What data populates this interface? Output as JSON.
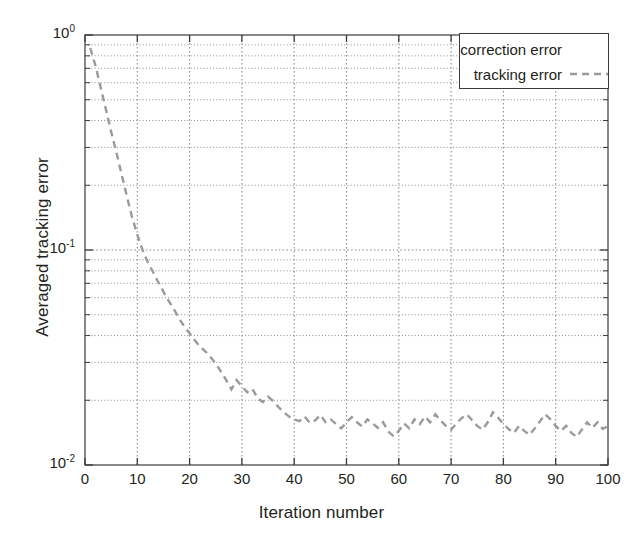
{
  "chart_data": {
    "type": "line",
    "title": "",
    "xlabel": "Iteration number",
    "ylabel": "Averaged tracking error",
    "yscale": "log",
    "xscale": "linear",
    "xlim": [
      0,
      100
    ],
    "ylim": [
      0.01,
      1
    ],
    "grid": true,
    "grid_style": "dotted",
    "grid_minor": true,
    "legend_position": "top-right",
    "xticks": [
      0,
      10,
      20,
      30,
      40,
      50,
      60,
      70,
      80,
      90,
      100
    ],
    "xtick_labels": [
      "0",
      "10",
      "20",
      "30",
      "40",
      "50",
      "60",
      "70",
      "80",
      "90",
      "100"
    ],
    "yticks": [
      0.01,
      0.1,
      1
    ],
    "ytick_labels": [
      "10⁻²",
      "10⁻¹",
      "10⁰"
    ],
    "ytick_mantissa": [
      "10",
      "10",
      "10"
    ],
    "ytick_exponent": [
      "-2",
      "-1",
      "0"
    ],
    "series": [
      {
        "name": "correction error",
        "linestyle": "solid",
        "color": "#ffffff",
        "visible_in_plot": false,
        "x": [],
        "values": []
      },
      {
        "name": "tracking error",
        "linestyle": "dashed",
        "color": "#9a9a9a",
        "visible_in_plot": true,
        "x": [
          1,
          2,
          3,
          4,
          5,
          6,
          7,
          8,
          9,
          10,
          11,
          12,
          13,
          14,
          15,
          16,
          17,
          18,
          19,
          20,
          21,
          22,
          23,
          24,
          25,
          26,
          27,
          28,
          29,
          30,
          31,
          32,
          33,
          34,
          35,
          36,
          37,
          38,
          39,
          40,
          41,
          42,
          43,
          44,
          45,
          46,
          47,
          48,
          49,
          50,
          51,
          52,
          53,
          54,
          55,
          56,
          57,
          58,
          59,
          60,
          61,
          62,
          63,
          64,
          65,
          66,
          67,
          68,
          69,
          70,
          71,
          72,
          73,
          74,
          75,
          76,
          77,
          78,
          79,
          80,
          81,
          82,
          83,
          84,
          85,
          86,
          87,
          88,
          89,
          90,
          91,
          92,
          93,
          94,
          95,
          96,
          97,
          98,
          99,
          100
        ],
        "values": [
          0.87,
          0.72,
          0.57,
          0.45,
          0.355,
          0.285,
          0.225,
          0.178,
          0.142,
          0.118,
          0.1,
          0.088,
          0.079,
          0.071,
          0.064,
          0.058,
          0.053,
          0.048,
          0.044,
          0.041,
          0.038,
          0.0355,
          0.0338,
          0.0318,
          0.0296,
          0.0272,
          0.0248,
          0.0225,
          0.0248,
          0.0232,
          0.0218,
          0.0226,
          0.0205,
          0.0196,
          0.0208,
          0.0198,
          0.0186,
          0.0176,
          0.0168,
          0.0163,
          0.016,
          0.0168,
          0.0157,
          0.0161,
          0.0171,
          0.0158,
          0.0163,
          0.0155,
          0.0148,
          0.0158,
          0.0167,
          0.0158,
          0.0151,
          0.0163,
          0.0156,
          0.0149,
          0.0158,
          0.0143,
          0.0136,
          0.0144,
          0.0156,
          0.0148,
          0.0163,
          0.0155,
          0.0168,
          0.0158,
          0.0172,
          0.0161,
          0.0152,
          0.0146,
          0.0156,
          0.0165,
          0.0172,
          0.0162,
          0.0152,
          0.0146,
          0.0158,
          0.0176,
          0.0166,
          0.0155,
          0.0147,
          0.0141,
          0.0152,
          0.0144,
          0.0138,
          0.0148,
          0.016,
          0.0172,
          0.0163,
          0.0152,
          0.0144,
          0.0152,
          0.0141,
          0.0135,
          0.0146,
          0.0158,
          0.0149,
          0.0158,
          0.0147,
          0.0152
        ]
      }
    ],
    "annotations": []
  },
  "legend": {
    "entries": [
      {
        "label": "correction error"
      },
      {
        "label": "tracking error"
      }
    ]
  },
  "axes": {
    "x_title": "Iteration number",
    "y_title": "Averaged tracking error"
  },
  "colors": {
    "curve": "#9a9a9a",
    "axis": "#3a3a3a",
    "grid": "#8d8d8d",
    "background": "#ffffff",
    "text": "#231f20"
  }
}
